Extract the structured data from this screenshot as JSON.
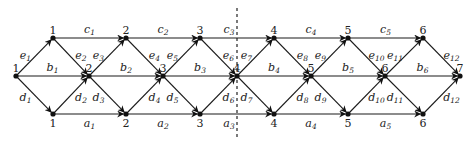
{
  "diagram": {
    "type": "layered-directed-graph",
    "colors": {
      "edge": "#1a1a1a",
      "node": "#111111",
      "text": "#222222",
      "background": "#ffffff"
    },
    "divider": {
      "x": 237,
      "y1": 8,
      "y2": 137,
      "style": "dashed"
    },
    "rows": {
      "top_y": 38,
      "middle_y": 76,
      "bottom_y": 114
    },
    "nodes": {
      "top": [
        {
          "id": "t1",
          "label": "1",
          "x": 53
        },
        {
          "id": "t2",
          "label": "2",
          "x": 126
        },
        {
          "id": "t3",
          "label": "3",
          "x": 200
        },
        {
          "id": "t4",
          "label": "4",
          "x": 274
        },
        {
          "id": "t5",
          "label": "5",
          "x": 348
        },
        {
          "id": "t6",
          "label": "6",
          "x": 423
        }
      ],
      "middle": [
        {
          "id": "m1",
          "label": "1",
          "x": 16
        },
        {
          "id": "m2",
          "label": "2",
          "x": 89
        },
        {
          "id": "m3",
          "label": "3",
          "x": 163
        },
        {
          "id": "m4",
          "label": "4",
          "x": 237
        },
        {
          "id": "m5",
          "label": "5",
          "x": 311
        },
        {
          "id": "m6",
          "label": "6",
          "x": 385
        },
        {
          "id": "m7",
          "label": "7",
          "x": 460
        }
      ],
      "bottom": [
        {
          "id": "b1",
          "label": "1",
          "x": 53
        },
        {
          "id": "b2",
          "label": "2",
          "x": 126
        },
        {
          "id": "b3",
          "label": "3",
          "x": 200
        },
        {
          "id": "b4",
          "label": "4",
          "x": 274
        },
        {
          "id": "b5",
          "label": "5",
          "x": 348
        },
        {
          "id": "b6",
          "label": "6",
          "x": 423
        }
      ]
    },
    "edge_labels": {
      "c": [
        {
          "base": "c",
          "sub": "1"
        },
        {
          "base": "c",
          "sub": "2"
        },
        {
          "base": "c",
          "sub": "3"
        },
        {
          "base": "c",
          "sub": "4"
        },
        {
          "base": "c",
          "sub": "5"
        }
      ],
      "b": [
        {
          "base": "b",
          "sub": "1"
        },
        {
          "base": "b",
          "sub": "2"
        },
        {
          "base": "b",
          "sub": "3"
        },
        {
          "base": "b",
          "sub": "4"
        },
        {
          "base": "b",
          "sub": "5"
        },
        {
          "base": "b",
          "sub": "6"
        }
      ],
      "a": [
        {
          "base": "a",
          "sub": "1"
        },
        {
          "base": "a",
          "sub": "2"
        },
        {
          "base": "a",
          "sub": "3"
        },
        {
          "base": "a",
          "sub": "4"
        },
        {
          "base": "a",
          "sub": "5"
        }
      ],
      "e": [
        {
          "base": "e",
          "sub": "1"
        },
        {
          "base": "e",
          "sub": "2"
        },
        {
          "base": "e",
          "sub": "3"
        },
        {
          "base": "e",
          "sub": "4"
        },
        {
          "base": "e",
          "sub": "5"
        },
        {
          "base": "e",
          "sub": "6"
        },
        {
          "base": "e",
          "sub": "7"
        },
        {
          "base": "e",
          "sub": "8"
        },
        {
          "base": "e",
          "sub": "9"
        },
        {
          "base": "e",
          "sub": "10"
        },
        {
          "base": "e",
          "sub": "11"
        },
        {
          "base": "e",
          "sub": "12"
        }
      ],
      "d": [
        {
          "base": "d",
          "sub": "1"
        },
        {
          "base": "d",
          "sub": "2"
        },
        {
          "base": "d",
          "sub": "3"
        },
        {
          "base": "d",
          "sub": "4"
        },
        {
          "base": "d",
          "sub": "5"
        },
        {
          "base": "d",
          "sub": "6"
        },
        {
          "base": "d",
          "sub": "7"
        },
        {
          "base": "d",
          "sub": "8"
        },
        {
          "base": "d",
          "sub": "9"
        },
        {
          "base": "d",
          "sub": "10"
        },
        {
          "base": "d",
          "sub": "11"
        },
        {
          "base": "d",
          "sub": "12"
        }
      ]
    }
  }
}
